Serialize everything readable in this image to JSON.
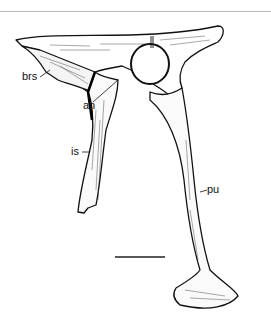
{
  "figure": {
    "labels": {
      "brs": "brs",
      "il": "il",
      "an": "an",
      "is": "is",
      "pu": "pu"
    },
    "scale_bar": {
      "x1": 115,
      "x2": 165,
      "y": 257
    }
  }
}
